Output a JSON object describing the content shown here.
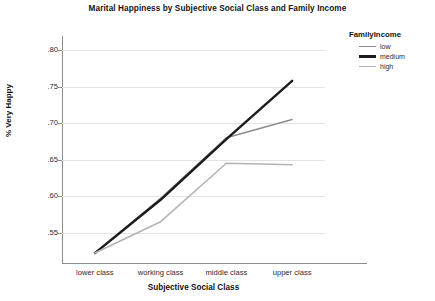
{
  "chart_data": {
    "type": "line",
    "title": "Marital Happiness by Subjective Social Class and Family Income",
    "xlabel": "Subjective Social Class",
    "ylabel": "% Very Happy",
    "categories": [
      "lower class",
      "working class",
      "middle class",
      "upper class"
    ],
    "series": [
      {
        "name": "low",
        "values": [
          0.522,
          0.597,
          0.68,
          0.705
        ],
        "color": "#8c8c8c",
        "width": 1.4
      },
      {
        "name": "medium",
        "values": [
          0.522,
          0.595,
          0.678,
          0.758
        ],
        "color": "#1c1c1c",
        "width": 2.4
      },
      {
        "name": "high",
        "values": [
          0.522,
          0.565,
          0.645,
          0.643
        ],
        "color": "#b4b4b4",
        "width": 1.6
      }
    ],
    "yticks": [
      ".80",
      ".75",
      ".70",
      ".65",
      ".60",
      ".55"
    ],
    "ytick_values": [
      0.8,
      0.75,
      0.7,
      0.65,
      0.6,
      0.55
    ],
    "ylim": [
      0.5125,
      0.8125
    ],
    "grid": true,
    "legend_title": "FamilyIncome",
    "legend_position": "right"
  },
  "legend": {
    "title": "FamilyIncome",
    "items": [
      {
        "label": "low"
      },
      {
        "label": "medium"
      },
      {
        "label": "high"
      }
    ]
  }
}
